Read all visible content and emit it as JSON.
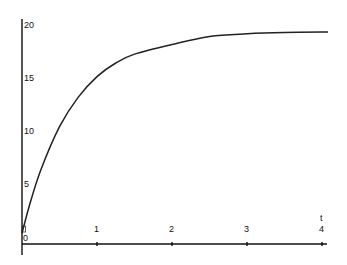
{
  "chart_data": {
    "type": "line",
    "title": "",
    "xlabel": "t",
    "ylabel": "",
    "xlim": [
      0,
      4
    ],
    "ylim": [
      0,
      20
    ],
    "grid": false,
    "legend": null,
    "x_ticks": [
      "0",
      "1",
      "2",
      "3",
      "4"
    ],
    "y_ticks": [
      "5",
      "10",
      "15",
      "20"
    ],
    "series": [
      {
        "name": "curve",
        "x": [
          0,
          0.1,
          0.25,
          0.5,
          0.75,
          1,
          1.25,
          1.5,
          2,
          2.5,
          3,
          3.5,
          4,
          4.08
        ],
        "values": [
          1.0,
          3.54,
          6.76,
          10.71,
          13.42,
          15.29,
          16.53,
          17.34,
          18.22,
          18.96,
          19.2,
          19.31,
          19.36,
          19.36
        ]
      }
    ]
  },
  "labels": {
    "x_axis_var": "t",
    "origin": "0",
    "x_tick_1": "1",
    "x_tick_2": "2",
    "x_tick_3": "3",
    "x_tick_4": "4",
    "y_tick_5": "5",
    "y_tick_10": "10",
    "y_tick_15": "15",
    "y_tick_20": "20"
  }
}
